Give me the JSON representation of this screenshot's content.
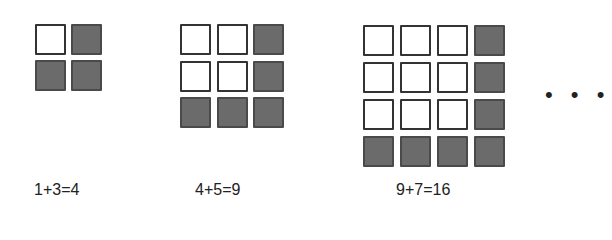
{
  "figures": [
    {
      "size": 2,
      "label": "1+3=4",
      "left": 35,
      "top": 24,
      "pitch": 35.5,
      "label_left": 34
    },
    {
      "size": 3,
      "label": "4+5=9",
      "left": 180,
      "top": 24,
      "pitch": 36.5,
      "label_left": 195
    },
    {
      "size": 4,
      "label": "9+7=16",
      "left": 363,
      "top": 25,
      "pitch": 37,
      "label_left": 396
    }
  ],
  "continuation": "• • •",
  "colors": {
    "empty": "#ffffff",
    "filled": "#6b6b6b",
    "border": "#333333"
  }
}
